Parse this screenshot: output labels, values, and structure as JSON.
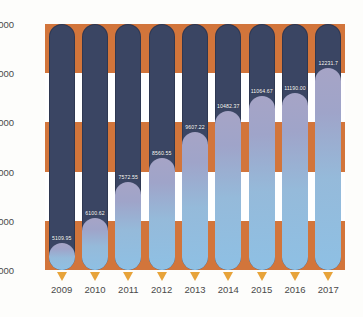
{
  "chart_data": {
    "type": "bar",
    "title": "",
    "subtitle": "",
    "xlabel": "",
    "ylabel": "",
    "categories": [
      "2009",
      "2010",
      "2011",
      "2012",
      "2013",
      "2014",
      "2015",
      "2016",
      "2017"
    ],
    "values": [
      5109.95,
      6100.62,
      7572.55,
      8560.55,
      9607.22,
      10482.37,
      11064.67,
      11190.0,
      12231.7
    ],
    "data_labels": [
      "5109.95",
      "6100.62",
      "7572.55",
      "8560.55",
      "9607.22",
      "10482.37",
      "11064.67",
      "11190.00",
      "12231.7"
    ],
    "ylim": [
      4000,
      14000
    ],
    "yticks": [
      4000,
      6000,
      8000,
      10000,
      12000,
      14000
    ],
    "ytick_labels": [
      "4000",
      "6000",
      "8000",
      "10000",
      "12000",
      "14000"
    ],
    "grid": false,
    "legend": null,
    "legend_position": "none",
    "annotations": {
      "marker_shape": "down-triangle",
      "marker_count": 9
    },
    "style": {
      "band_ranges": [
        [
          12000,
          14000
        ],
        [
          8000,
          10000
        ],
        [
          4000,
          6000
        ]
      ],
      "band_color": "#d2753b",
      "band_alt_color": "#ffffff",
      "track_color": "#3a4563",
      "fill_gradient_bottom": "#8ec0e4",
      "fill_gradient_top": "#a6a4c6",
      "marker_color": "#e7a33a",
      "label_color": "#ffffff",
      "axis_text_color": "#4a4a4a",
      "background": "#fdfdfb"
    }
  }
}
